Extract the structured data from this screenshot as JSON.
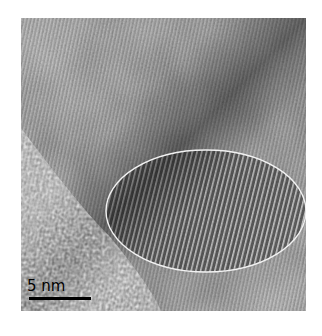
{
  "image": {
    "kind": "TEM micrograph",
    "description": "High-resolution TEM image showing crystalline lattice fringes with an amorphous region at lower left; a highlighted elliptical region marks strong fringes.",
    "annotation": {
      "shape": "ellipse",
      "color": "#f2f2f2"
    },
    "scale_bar": {
      "label": "5 nm",
      "color": "#000000"
    }
  }
}
